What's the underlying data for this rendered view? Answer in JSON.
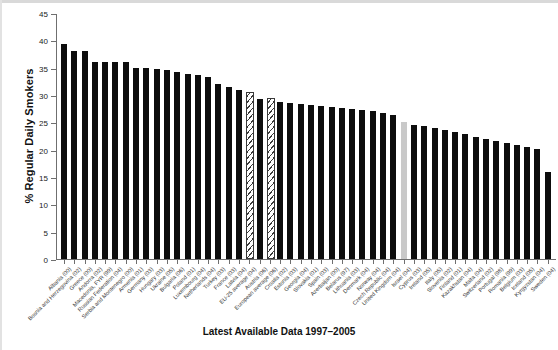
{
  "chart_data": {
    "type": "bar",
    "title": "",
    "xlabel": "Latest Available Data 1997–2005",
    "ylabel": "% Regular Daily Smokers",
    "ylim": [
      0,
      45
    ],
    "yticks": [
      0,
      5,
      10,
      15,
      20,
      25,
      30,
      35,
      40,
      45
    ],
    "grid": false,
    "legend": "none",
    "categories": [
      "Albania (00)",
      "Bosnia and Herzegovina (02)",
      "Greece (00)",
      "Andorra (02)",
      "Macedonia, FYR (99)",
      "Russian Federation (04)",
      "Serbia and Montenegro (00)",
      "Armenia (01)",
      "Germany (03)",
      "Hungary (03)",
      "Ukraine (05)",
      "Bulgaria (06)",
      "Poland (01)",
      "Luxembourg (04)",
      "Netherlands (04)",
      "Turkey (03)",
      "France (03)",
      "Latvia (04)",
      "EU-25 average (04)",
      "Austria (06)",
      "European average (06)",
      "Croatia (02)",
      "Estonia (03)",
      "Georgia (04)",
      "Slovakia (01)",
      "Spain (03)",
      "Azerbaijan (00)",
      "Belarus (97)",
      "Lithuania (03)",
      "Denmark (04)",
      "Norway (04)",
      "Czech Republic (04)",
      "United Kingdom (04)",
      "Israel (04)",
      "Cyprus (03)",
      "Ireland (05)",
      "Italy (05)",
      "Slovenia (02)",
      "Finland (01)",
      "Kazakhstan (04)",
      "Malta (04)",
      "Switzerland (02)",
      "Portugal (98)",
      "Romania (99)",
      "Belgium (03)",
      "Iceland (05)",
      "Kyrgyzstan (04)",
      "Sweden (04)"
    ],
    "values": [
      39.4,
      38.0,
      38.0,
      36.0,
      36.0,
      36.0,
      36.0,
      35.0,
      35.0,
      34.8,
      34.5,
      34.2,
      33.9,
      33.6,
      33.3,
      32.0,
      31.5,
      31.0,
      30.2,
      29.2,
      29.0,
      28.8,
      28.6,
      28.4,
      28.2,
      28.0,
      27.8,
      27.6,
      27.4,
      27.2,
      27.0,
      26.8,
      26.4,
      25.0,
      24.6,
      24.3,
      24.0,
      23.6,
      23.2,
      22.8,
      22.4,
      22.0,
      21.5,
      21.2,
      20.8,
      20.4,
      20.2,
      16.0
    ],
    "series_styles": [
      "solid",
      "solid",
      "solid",
      "solid",
      "solid",
      "solid",
      "solid",
      "solid",
      "solid",
      "solid",
      "solid",
      "solid",
      "solid",
      "solid",
      "solid",
      "solid",
      "solid",
      "solid",
      "hatch",
      "solid",
      "hatch",
      "solid",
      "solid",
      "solid",
      "solid",
      "solid",
      "solid",
      "solid",
      "solid",
      "solid",
      "solid",
      "solid",
      "solid",
      "grey",
      "solid",
      "solid",
      "solid",
      "solid",
      "solid",
      "solid",
      "solid",
      "solid",
      "solid",
      "solid",
      "solid",
      "solid",
      "solid",
      "solid"
    ],
    "colors": {
      "bar_solid": "#0d0d0d",
      "bar_grey": "#c9c9c9",
      "bar_hatch_line": "#3a3a3a",
      "axis": "#6f6f6f",
      "text": "#111111",
      "background": "#ffffff"
    }
  }
}
